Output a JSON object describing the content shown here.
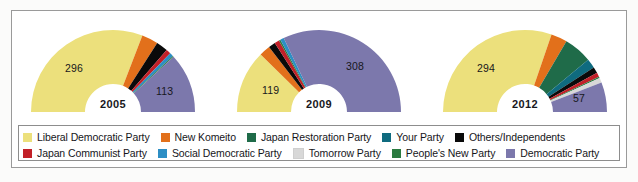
{
  "chart_data": {
    "type": "pie",
    "title": "",
    "subtype": "semicircle-donut",
    "note": "Japanese House of Representatives seat distribution by general election year",
    "legend_position": "bottom",
    "parties": [
      {
        "name": "Liberal Democratic Party",
        "color": "#ece07c"
      },
      {
        "name": "New Komeito",
        "color": "#e2701b"
      },
      {
        "name": "Japan Restoration Party",
        "color": "#1f6b49"
      },
      {
        "name": "Your Party",
        "color": "#0f6b7f"
      },
      {
        "name": "Others/Independents",
        "color": "#0a0a0a"
      },
      {
        "name": "Japan Communist Party",
        "color": "#c22028"
      },
      {
        "name": "Social Democratic Party",
        "color": "#2d8ec4"
      },
      {
        "name": "Tomorrow Party",
        "color": "#d8d8d8"
      },
      {
        "name": "People's New Party",
        "color": "#2a7a3f"
      },
      {
        "name": "Democratic Party",
        "color": "#7c78ac"
      }
    ],
    "charts": [
      {
        "year": "2005",
        "labels_shown": [
          {
            "party": "Liberal Democratic Party",
            "value": "296"
          },
          {
            "party": "Democratic Party",
            "value": "113"
          }
        ],
        "slices": [
          {
            "party": "Liberal Democratic Party",
            "value": 296,
            "color": "#ece07c"
          },
          {
            "party": "New Komeito",
            "value": 31,
            "color": "#e2701b"
          },
          {
            "party": "Others/Independents",
            "value": 22,
            "color": "#0a0a0a"
          },
          {
            "party": "Japan Communist Party",
            "value": 9,
            "color": "#c22028"
          },
          {
            "party": "Social Democratic Party",
            "value": 7,
            "color": "#2d8ec4"
          },
          {
            "party": "People's New Party",
            "value": 2,
            "color": "#2a7a3f"
          },
          {
            "party": "Democratic Party",
            "value": 113,
            "color": "#7c78ac"
          }
        ],
        "total": 480
      },
      {
        "year": "2009",
        "labels_shown": [
          {
            "party": "Liberal Democratic Party",
            "value": "119"
          },
          {
            "party": "Democratic Party",
            "value": "308"
          }
        ],
        "slices": [
          {
            "party": "Liberal Democratic Party",
            "value": 119,
            "color": "#ece07c"
          },
          {
            "party": "New Komeito",
            "value": 21,
            "color": "#e2701b"
          },
          {
            "party": "Others/Independents",
            "value": 13,
            "color": "#0a0a0a"
          },
          {
            "party": "Japan Communist Party",
            "value": 9,
            "color": "#c22028"
          },
          {
            "party": "People's New Party",
            "value": 3,
            "color": "#2a7a3f"
          },
          {
            "party": "Social Democratic Party",
            "value": 7,
            "color": "#2d8ec4"
          },
          {
            "party": "Democratic Party",
            "value": 308,
            "color": "#7c78ac"
          }
        ],
        "total": 480
      },
      {
        "year": "2012",
        "labels_shown": [
          {
            "party": "Liberal Democratic Party",
            "value": "294"
          },
          {
            "party": "Democratic Party",
            "value": "57"
          }
        ],
        "slices": [
          {
            "party": "Liberal Democratic Party",
            "value": 294,
            "color": "#ece07c"
          },
          {
            "party": "New Komeito",
            "value": 31,
            "color": "#e2701b"
          },
          {
            "party": "Japan Restoration Party",
            "value": 54,
            "color": "#1f6b49"
          },
          {
            "party": "Your Party",
            "value": 18,
            "color": "#0f6b7f"
          },
          {
            "party": "Others/Independents",
            "value": 12,
            "color": "#0a0a0a"
          },
          {
            "party": "Japan Communist Party",
            "value": 8,
            "color": "#c22028"
          },
          {
            "party": "People's New Party",
            "value": 3,
            "color": "#2a7a3f"
          },
          {
            "party": "Tomorrow Party",
            "value": 9,
            "color": "#d8d8d8"
          },
          {
            "party": "Democratic Party",
            "value": 57,
            "color": "#7c78ac"
          }
        ],
        "total": 486
      }
    ]
  },
  "legend": {
    "row1": [
      {
        "label": "Liberal Democratic Party",
        "color": "#ece07c"
      },
      {
        "label": "New Komeito",
        "color": "#e2701b"
      },
      {
        "label": "Japan Restoration Party",
        "color": "#1f6b49"
      },
      {
        "label": "Your Party",
        "color": "#0f6b7f"
      },
      {
        "label": "Others/Independents",
        "color": "#0a0a0a"
      }
    ],
    "row2": [
      {
        "label": "Japan Communist Party",
        "color": "#c22028"
      },
      {
        "label": "Social Democratic Party",
        "color": "#2d8ec4"
      },
      {
        "label": "Tomorrow Party",
        "color": "#d8d8d8"
      },
      {
        "label": "People's New Party",
        "color": "#2a7a3f"
      },
      {
        "label": "Democratic Party",
        "color": "#7c78ac"
      }
    ]
  }
}
